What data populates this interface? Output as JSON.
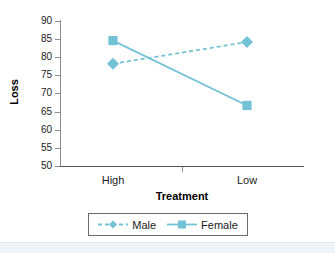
{
  "chart_data": {
    "type": "line",
    "title": "",
    "xlabel": "Treatment",
    "ylabel": "Loss",
    "categories": [
      "High",
      "Low"
    ],
    "ylim": [
      50,
      90
    ],
    "yticks": [
      50,
      55,
      60,
      65,
      70,
      75,
      80,
      85,
      90
    ],
    "ytick_labels": [
      "50",
      "55",
      "60",
      "65",
      "70",
      "75",
      "80",
      "85",
      "90"
    ],
    "grid": false,
    "legend_position": "bottom",
    "series": [
      {
        "name": "Male",
        "values": [
          78.2,
          84.2
        ],
        "color": "#74c2d6",
        "line_style": "dashed",
        "marker": "diamond"
      },
      {
        "name": "Female",
        "values": [
          84.6,
          66.7
        ],
        "color": "#74c2d6",
        "line_style": "solid",
        "marker": "square"
      }
    ]
  },
  "axes": {
    "y_title": "Loss",
    "x_title": "Treatment",
    "y_labels": [
      "90",
      "85",
      "80",
      "75",
      "70",
      "65",
      "60",
      "55",
      "50"
    ],
    "x_labels": [
      "High",
      "Low"
    ]
  },
  "legend": {
    "entries": [
      {
        "label": "Male"
      },
      {
        "label": "Female"
      }
    ]
  },
  "colors": {
    "series": "#74c2d6",
    "axis": "#8c8c8c",
    "text": "#1a1a1a",
    "band": "#eef4f7"
  }
}
